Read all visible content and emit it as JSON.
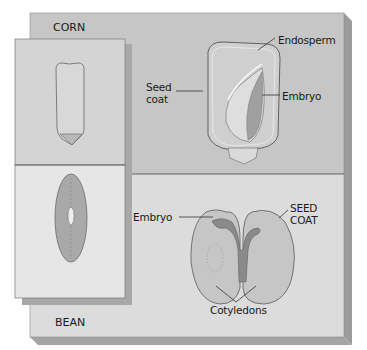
{
  "figure": {
    "panels": {
      "corn": {
        "section_label": "CORN",
        "background": "#c6c6c6",
        "labels": {
          "endosperm": "Endosperm",
          "seed_coat_line1": "Seed",
          "seed_coat_line2": "coat",
          "embryo": "Embryo"
        }
      },
      "bean": {
        "section_label": "BEAN",
        "background": "#dcdcdc",
        "labels": {
          "embryo": "Embryo",
          "seed_coat_line1": "SEED",
          "seed_coat_line2": "COAT",
          "cotyledons": "Cotyledons"
        }
      }
    },
    "colors": {
      "inset_corn_bg": "#d4d4d4",
      "inset_bean_bg": "#e6e6e6",
      "edge_shadow": "#9a9a9a",
      "seed_fill": "#bdbdbd",
      "outline": "#555555"
    }
  }
}
